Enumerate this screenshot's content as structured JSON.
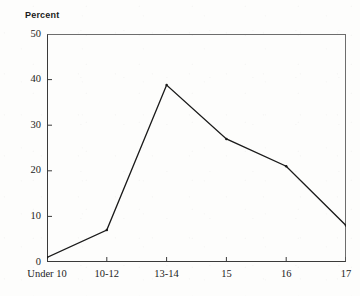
{
  "chart_data": {
    "type": "line",
    "title": "",
    "subtitle": "",
    "xlabel": "",
    "ylabel": "Percent",
    "categories": [
      "Under 10",
      "10-12",
      "13-14",
      "15",
      "16",
      "17"
    ],
    "values": [
      1,
      7,
      38.8,
      27,
      21,
      8
    ],
    "series": [
      {
        "name": "Percent",
        "values": [
          1,
          7,
          38.8,
          27,
          21,
          8
        ]
      }
    ],
    "ylim": [
      0,
      50
    ],
    "ytick_labels": [
      "0",
      "10",
      "20",
      "30",
      "40",
      "50"
    ],
    "ytick_values": [
      0,
      10,
      20,
      30,
      40,
      50
    ],
    "grid": false,
    "legend": false,
    "legend_position": "none",
    "marker": "dot",
    "line_color": "#1a1a1a",
    "frame": true,
    "tick_direction": "in"
  },
  "axis": {
    "y_title": "Percent"
  },
  "colors": {
    "ink": "#1a1a1a",
    "frame": "#5e5e5e",
    "background": "#fdfdfc"
  }
}
